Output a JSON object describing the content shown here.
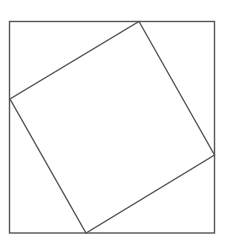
{
  "diagram": {
    "type": "geometric-figure",
    "stroke_color": "#555555",
    "background": "#ffffff",
    "outer_square": {
      "x": 9.5,
      "y": 21.5,
      "width": 205,
      "height": 211.5
    },
    "inner_square": {
      "points": [
        [
          139,
          21.5
        ],
        [
          214.5,
          155
        ],
        [
          86,
          233
        ],
        [
          10,
          99
        ]
      ]
    }
  }
}
